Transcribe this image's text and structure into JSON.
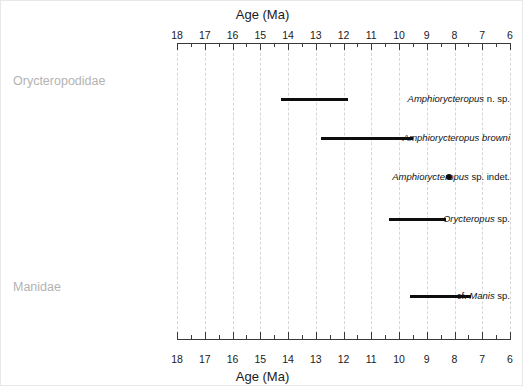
{
  "figure": {
    "axis_title_top": "Age (Ma)",
    "axis_title_bottom": "Age (Ma)",
    "accent_color": "#0d0d0d",
    "grid_color": "#d6d6d6",
    "family_label_color": "#b3b3b3"
  },
  "chart_data": {
    "type": "bar",
    "orientation": "horizontal-range",
    "title": "Age (Ma)",
    "xlabel": "Age (Ma)",
    "ylabel": "",
    "xlim": [
      18,
      6
    ],
    "x_inverted": true,
    "grid": true,
    "legend": "none",
    "tick_labels": [
      "18",
      "17",
      "16",
      "15",
      "14",
      "13",
      "12",
      "11",
      "10",
      "9",
      "8",
      "7",
      "6"
    ],
    "tick_values": [
      18,
      17,
      16,
      15,
      14,
      13,
      12,
      11,
      10,
      9,
      8,
      7,
      6
    ],
    "minor_ticks": [
      17.5,
      16.5,
      15.5,
      14.5,
      13.5,
      12.5,
      11.5,
      10.5,
      9.5,
      8.5,
      7.5,
      6.5
    ],
    "groups": [
      {
        "name": "Orycteropodidae",
        "taxa": [
          {
            "label_italic": "Amphiorycteropus",
            "label_plain": " n. sp.",
            "marker": "range",
            "start": 14.25,
            "end": 11.85
          },
          {
            "label_italic": "Amphiorycteropus browni",
            "label_plain": "",
            "marker": "range",
            "start": 12.8,
            "end": 9.5
          },
          {
            "label_italic": "Amphiorycteropus",
            "label_plain": " sp. indet.",
            "marker": "point",
            "start": 8.2,
            "end": 8.2
          },
          {
            "label_italic": "Orycteropus",
            "label_plain": " sp.",
            "marker": "range",
            "start": 10.35,
            "end": 8.3
          }
        ]
      },
      {
        "name": "Manidae",
        "taxa": [
          {
            "label_italic": "Manis",
            "label_plain": " sp.",
            "label_prefix": "cf. ",
            "marker": "range",
            "start": 9.6,
            "end": 7.4
          }
        ]
      }
    ]
  }
}
